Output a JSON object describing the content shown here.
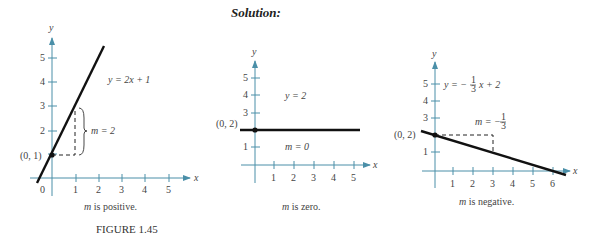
{
  "heading": "Solution:",
  "figure_label": "FIGURE  1.45",
  "graphs": [
    {
      "equation": "y = 2x + 1",
      "point_label": "(0, 1)",
      "slope_label": "m = 2",
      "caption_m": "m",
      "caption_rest": " is positive.",
      "x_ticks": [
        "1",
        "2",
        "3",
        "4",
        "5"
      ],
      "y_ticks": [
        "1",
        "2",
        "3",
        "4",
        "5"
      ],
      "origin": "0",
      "x_label": "x",
      "y_label": "y"
    },
    {
      "equation": "y = 2",
      "point_label": "(0, 2)",
      "slope_label": "m = 0",
      "caption_m": "m",
      "caption_rest": " is zero.",
      "x_ticks": [
        "1",
        "2",
        "3",
        "4",
        "5"
      ],
      "y_ticks": [
        "1",
        "2",
        "3",
        "4",
        "5"
      ],
      "x_label": "x",
      "y_label": "y"
    },
    {
      "equation_pre": "y = −",
      "equation_frac_num": "1",
      "equation_frac_den": "3",
      "equation_post": "x + 2",
      "point_label": "(0, 2)",
      "slope_pre": "m = −",
      "slope_frac_num": "1",
      "slope_frac_den": "3",
      "caption_m": "m",
      "caption_rest": " is negative.",
      "x_ticks": [
        "1",
        "2",
        "3",
        "4",
        "5",
        "6"
      ],
      "y_ticks": [
        "1",
        "2",
        "3",
        "4",
        "5"
      ],
      "x_label": "x",
      "y_label": "y"
    }
  ],
  "colors": {
    "axis": "#4a8fa8",
    "line": "#111111"
  }
}
